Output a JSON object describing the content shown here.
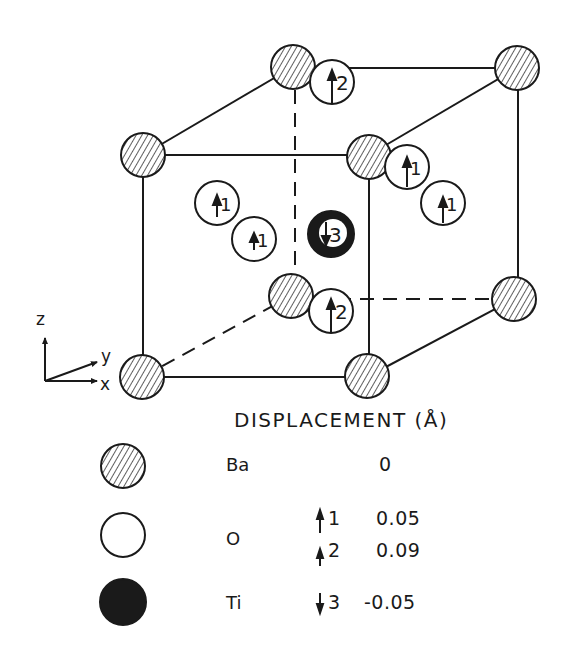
{
  "figure": {
    "axes": {
      "z_label": "z",
      "y_label": "y",
      "x_label": "x"
    },
    "atom_labels": {
      "o_top": "2",
      "o_right_upper": "1",
      "o_right_lower": "1",
      "o_left_upper": "1",
      "o_left_lower": "1",
      "ti_center": "3",
      "o_bottom": "2"
    }
  },
  "legend": {
    "header": "DISPLACEMENT (Å)",
    "rows": [
      {
        "element": "Ba",
        "style": "hatched",
        "entries": [
          {
            "index": "",
            "value": "0"
          }
        ]
      },
      {
        "element": "O",
        "style": "open",
        "entries": [
          {
            "index": "1",
            "direction": "up",
            "value": "0.05"
          },
          {
            "index": "2",
            "direction": "up",
            "value": "0.09"
          }
        ]
      },
      {
        "element": "Ti",
        "style": "filled",
        "entries": [
          {
            "index": "3",
            "direction": "down",
            "value": "-0.05"
          }
        ]
      }
    ]
  },
  "colors": {
    "ink": "#1a1a1a",
    "background": "#ffffff"
  }
}
